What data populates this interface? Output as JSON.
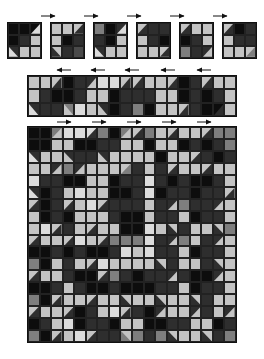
{
  "palette": {
    "K": "#0d0d0d",
    "D": "#2e2e2e",
    "M": "#4a4a4a",
    "G": "#7e7e7e",
    "L": "#c4c4c4",
    "W": "#dcdcdc"
  },
  "diagram": {
    "step1_blocks": [
      {
        "x": 7,
        "rows": [
          [
            "K",
            "K",
            "K/W:tr"
          ],
          [
            "K",
            "D",
            "L"
          ],
          [
            "D/W:bl",
            "L",
            "L"
          ]
        ]
      },
      {
        "x": 50,
        "rows": [
          [
            "L",
            "L",
            "L/D:tr"
          ],
          [
            "L",
            "K",
            "D"
          ],
          [
            "L/D:bl",
            "D",
            "M"
          ]
        ]
      },
      {
        "x": 93,
        "rows": [
          [
            "G",
            "K",
            "D/W:tr"
          ],
          [
            "D",
            "K",
            "L"
          ],
          [
            "D/W:bl",
            "L",
            "L"
          ]
        ]
      },
      {
        "x": 136,
        "rows": [
          [
            "D/L:tl",
            "D",
            "D"
          ],
          [
            "L",
            "D",
            "K"
          ],
          [
            "L",
            "L",
            "L/D:br"
          ]
        ]
      },
      {
        "x": 179,
        "rows": [
          [
            "D/L:tl",
            "L",
            "L"
          ],
          [
            "K",
            "D",
            "L"
          ],
          [
            "G",
            "D",
            "D/L:br"
          ]
        ]
      },
      {
        "x": 222,
        "rows": [
          [
            "D/L:tl",
            "K",
            "D"
          ],
          [
            "L",
            "D",
            "D"
          ],
          [
            "L",
            "L",
            "L/G:br"
          ]
        ]
      }
    ],
    "step1_arrows": [
      {
        "x": 40,
        "dir": "right"
      },
      {
        "x": 83,
        "dir": "right"
      },
      {
        "x": 126,
        "dir": "right"
      },
      {
        "x": 169,
        "dir": "right"
      },
      {
        "x": 212,
        "dir": "right"
      }
    ],
    "step2_strip": {
      "rows": [
        [
          "L",
          "L",
          "L/D:tr",
          "K",
          "D",
          "D/L:tr",
          "W",
          "W",
          "L/D:tr",
          "D/L:tl",
          "L",
          "L",
          "D/L:tl",
          "K",
          "D",
          "D/L:tl",
          "L",
          "L"
        ],
        [
          "L",
          "D",
          "K",
          "K",
          "D",
          "L",
          "L",
          "K",
          "D",
          "D",
          "D",
          "L",
          "L",
          "K",
          "D",
          "K",
          "D",
          "L"
        ],
        [
          "D/W:bl",
          "D",
          "D",
          "G/L:bl",
          "W",
          "L",
          "D/L:bl",
          "K",
          "D",
          "G",
          "K",
          "L",
          "L",
          "L/D:br",
          "D",
          "K",
          "K/D:br",
          "L"
        ]
      ]
    },
    "step2_arrows": [
      {
        "x": 56,
        "dir": "left"
      },
      {
        "x": 90,
        "dir": "left"
      },
      {
        "x": 124,
        "dir": "left"
      },
      {
        "x": 160,
        "dir": "left"
      },
      {
        "x": 196,
        "dir": "left"
      }
    ],
    "step3_grid": {
      "rows": [
        [
          "K",
          "K",
          "G/L:tr",
          "W",
          "W",
          "W/D:tr",
          "G",
          "K",
          "G/L:tr",
          "D/L:tl",
          "G",
          "L",
          "D/L:tl",
          "L",
          "L",
          "D/L:tl",
          "G",
          "G"
        ],
        [
          "K",
          "K",
          "L",
          "L",
          "K",
          "K",
          "D",
          "D",
          "L",
          "L",
          "K",
          "L",
          "L",
          "K",
          "D",
          "K",
          "D",
          "G"
        ],
        [
          "D/W:bl",
          "L",
          "L",
          "D/L:bl",
          "D",
          "D",
          "D/L:bl",
          "L",
          "L",
          "L",
          "L",
          "K",
          "L",
          "L",
          "L/D:br",
          "D",
          "K",
          "D"
        ],
        [
          "L",
          "L",
          "D/L:tr",
          "G",
          "D/L:tr",
          "L",
          "L",
          "L",
          "G/L:tl",
          "D",
          "L",
          "D",
          "D/L:tl",
          "L",
          "L",
          "D/L:tl",
          "L",
          "L"
        ],
        [
          "W",
          "D",
          "D",
          "K",
          "K",
          "L",
          "L",
          "K",
          "D",
          "D",
          "W",
          "D",
          "K",
          "D",
          "K",
          "K",
          "D",
          "L"
        ],
        [
          "D/W:bl",
          "K",
          "D",
          "L",
          "W",
          "L",
          "L",
          "K",
          "K",
          "D",
          "W",
          "K",
          "D",
          "D",
          "K",
          "D",
          "D",
          "L/D:br"
        ],
        [
          "D/L:tl",
          "K",
          "D",
          "D/L:tl",
          "L",
          "W",
          "D/L:tl",
          "D",
          "D",
          "D",
          "L",
          "D",
          "D/L:tr",
          "G",
          "D",
          "D",
          "D/L:tr",
          "L"
        ],
        [
          "L",
          "K",
          "D",
          "K",
          "L",
          "L",
          "L",
          "D",
          "K",
          "K",
          "L",
          "D",
          "D",
          "L",
          "K",
          "D",
          "D",
          "L"
        ],
        [
          "L",
          "W",
          "L/D:br",
          "D",
          "L",
          "L/D:br",
          "L",
          "L",
          "K",
          "K",
          "W",
          "L",
          "L/D:bl",
          "D",
          "L",
          "L",
          "L/D:bl",
          "G"
        ],
        [
          "D/L:tl",
          "L",
          "L",
          "D/L:tl",
          "W",
          "L",
          "D/L:tl",
          "G",
          "G",
          "G",
          "W",
          "D",
          "D/L:tr",
          "G",
          "L",
          "D",
          "D/L:tr",
          "L"
        ],
        [
          "K",
          "K",
          "D",
          "K",
          "D",
          "K",
          "K",
          "D",
          "W",
          "L",
          "W",
          "D",
          "D",
          "L",
          "K",
          "D",
          "D",
          "L"
        ],
        [
          "G",
          "K",
          "L",
          "D",
          "L",
          "L/D:br",
          "W",
          "L",
          "L",
          "L",
          "L",
          "L/D:bl",
          "D",
          "L",
          "L",
          "D",
          "L/D:bl",
          "L"
        ],
        [
          "D/L:tl",
          "L",
          "L",
          "D",
          "K",
          "K",
          "D/L:tl",
          "G",
          "D",
          "K",
          "D",
          "D",
          "D/L:tr",
          "D",
          "K",
          "K",
          "D/L:tr",
          "L"
        ],
        [
          "K",
          "K",
          "D",
          "L",
          "D",
          "K",
          "K",
          "D",
          "K",
          "K",
          "K",
          "D",
          "D",
          "L",
          "K",
          "D",
          "D",
          "L"
        ],
        [
          "G",
          "K",
          "L/D:br",
          "L",
          "L",
          "L/D:br",
          "L",
          "L",
          "L/D:bl",
          "L",
          "L",
          "L/D:bl",
          "L",
          "L",
          "L/D:bl",
          "D",
          "L",
          "L"
        ],
        [
          "D/L:tl",
          "L",
          "L",
          "D/L:tl",
          "K",
          "D",
          "L",
          "W",
          "L/D:tr",
          "D",
          "K",
          "D/L:tr",
          "L",
          "L",
          "D/L:tr",
          "D",
          "L",
          "D/L:tr"
        ],
        [
          "K",
          "D",
          "L",
          "W",
          "K",
          "D",
          "D",
          "K",
          "L",
          "L",
          "K",
          "K",
          "D",
          "D",
          "L",
          "L",
          "K",
          "D"
        ],
        [
          "G",
          "K",
          "L/D:br",
          "L",
          "W",
          "L/D:br",
          "D",
          "D",
          "L/G:bl",
          "G",
          "D",
          "G",
          "L/D:bl",
          "L",
          "L",
          "L/D:bl",
          "D",
          "G"
        ]
      ]
    },
    "step3_arrows": [
      {
        "x": 56,
        "dir": "right"
      },
      {
        "x": 91,
        "dir": "right"
      },
      {
        "x": 126,
        "dir": "right"
      },
      {
        "x": 161,
        "dir": "right"
      },
      {
        "x": 196,
        "dir": "right"
      }
    ]
  }
}
